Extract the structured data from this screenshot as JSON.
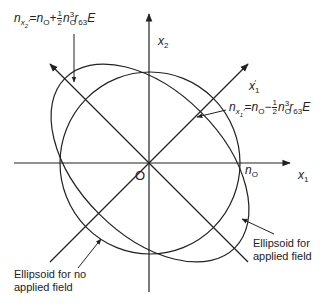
{
  "diagram": {
    "type": "index ellipsoid cross-section under applied field",
    "axes": {
      "x1": {
        "label": "x",
        "sub": "1"
      },
      "x2": {
        "label": "x",
        "sub": "2"
      },
      "x1_prime": {
        "label": "x",
        "sub": "1",
        "sup": "′"
      }
    },
    "origin_label": "O",
    "no_label": {
      "n": "n",
      "sub": "O"
    },
    "equations": {
      "top_left": {
        "lhs_n": "n",
        "lhs_sub": "x",
        "lhs_subsub": "2",
        "lhs_prime": "′",
        "eq": "=",
        "n0": "n",
        "n0_sub": "O",
        "op": "+",
        "frac_num": "1",
        "frac_den": "2",
        "n_cubed": "n",
        "n_cubed_sub": "O",
        "n_cubed_sup": "3",
        "r": "r",
        "r_sub": "63",
        "E": "E"
      },
      "right": {
        "lhs_n": "n",
        "lhs_sub": "x",
        "lhs_subsub": "1",
        "lhs_prime": "′",
        "eq": "=",
        "n0": "n",
        "n0_sub": "O",
        "op": "−",
        "frac_num": "1",
        "frac_den": "2",
        "n_cubed": "n",
        "n_cubed_sub": "O",
        "n_cubed_sup": "3",
        "r": "r",
        "r_sub": "63",
        "E": "E"
      }
    },
    "annotations": {
      "no_field": {
        "line1": "Ellipsoid for no",
        "line2": "applied field"
      },
      "applied_field": {
        "line1": "Ellipsoid for",
        "line2": "applied field"
      }
    },
    "colors": {
      "stroke": "#222222",
      "background": "#ffffff"
    }
  }
}
